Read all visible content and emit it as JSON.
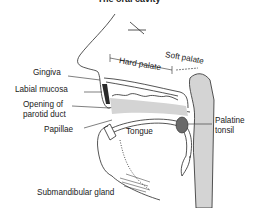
{
  "title": "The oral cavity",
  "labels": {
    "gingiva": "Gingiva",
    "labial_mucosa": "Labial mucosa",
    "parotid_1": "Opening of",
    "parotid_2": "parotid duct",
    "papillae": "Papillae",
    "tongue": "Tongue",
    "hard_palate": "Hard palate",
    "soft_palate": "Soft palate",
    "palatine_1": "Palatine",
    "palatine_2": "tonsil",
    "submandibular": "Submandibular gland"
  },
  "colors": {
    "line": "#2a2a2a",
    "fill": "#d4d4d4",
    "tonsil": "#6a6a6a"
  }
}
